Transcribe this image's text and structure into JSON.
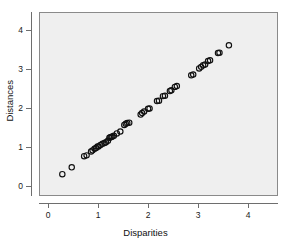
{
  "chart_data": {
    "type": "scatter",
    "title": "",
    "xlabel": "Disparities",
    "ylabel": "Distances",
    "xlim": [
      -0.18,
      4.6
    ],
    "ylim": [
      -0.27,
      4.46
    ],
    "xticks": [
      0,
      1,
      2,
      3,
      4
    ],
    "yticks": [
      0,
      1,
      2,
      3,
      4
    ],
    "xtick_labels": [
      "0",
      "1",
      "2",
      "3",
      "4"
    ],
    "ytick_labels": [
      "0",
      "1",
      "2",
      "3",
      "4"
    ],
    "grid": false,
    "legend": false,
    "marker": "open-circle",
    "marker_color": "#101010",
    "panel_color": "#efefef",
    "border_color": "#8a8a8a",
    "n_points": 50,
    "series": [
      {
        "name": "points",
        "points": [
          [
            0.27,
            0.27
          ],
          [
            0.46,
            0.45
          ],
          [
            0.71,
            0.74
          ],
          [
            0.76,
            0.76
          ],
          [
            0.85,
            0.86
          ],
          [
            0.88,
            0.89
          ],
          [
            0.92,
            0.93
          ],
          [
            0.95,
            0.95
          ],
          [
            0.98,
            0.99
          ],
          [
            1.0,
            0.99
          ],
          [
            1.04,
            1.03
          ],
          [
            1.08,
            1.06
          ],
          [
            1.12,
            1.08
          ],
          [
            1.15,
            1.1
          ],
          [
            1.19,
            1.14
          ],
          [
            1.22,
            1.22
          ],
          [
            1.24,
            1.23
          ],
          [
            1.26,
            1.24
          ],
          [
            1.28,
            1.25
          ],
          [
            1.31,
            1.27
          ],
          [
            1.37,
            1.33
          ],
          [
            1.44,
            1.38
          ],
          [
            1.52,
            1.55
          ],
          [
            1.55,
            1.58
          ],
          [
            1.58,
            1.6
          ],
          [
            1.62,
            1.61
          ],
          [
            1.85,
            1.82
          ],
          [
            1.88,
            1.86
          ],
          [
            1.92,
            1.9
          ],
          [
            2.0,
            1.97
          ],
          [
            2.03,
            1.98
          ],
          [
            2.18,
            2.17
          ],
          [
            2.22,
            2.18
          ],
          [
            2.3,
            2.3
          ],
          [
            2.34,
            2.31
          ],
          [
            2.44,
            2.43
          ],
          [
            2.47,
            2.45
          ],
          [
            2.54,
            2.54
          ],
          [
            2.58,
            2.56
          ],
          [
            2.87,
            2.84
          ],
          [
            2.91,
            2.86
          ],
          [
            3.03,
            3.02
          ],
          [
            3.07,
            3.06
          ],
          [
            3.11,
            3.1
          ],
          [
            3.15,
            3.12
          ],
          [
            3.21,
            3.21
          ],
          [
            3.25,
            3.23
          ],
          [
            3.41,
            3.42
          ],
          [
            3.44,
            3.43
          ],
          [
            3.63,
            3.62
          ]
        ]
      }
    ]
  },
  "axes": {
    "x": {
      "title": "Disparities",
      "ticks": [
        {
          "value": 0,
          "label": "0"
        },
        {
          "value": 1,
          "label": "1"
        },
        {
          "value": 2,
          "label": "2"
        },
        {
          "value": 3,
          "label": "3"
        },
        {
          "value": 4,
          "label": "4"
        }
      ]
    },
    "y": {
      "title": "Distances",
      "ticks": [
        {
          "value": 0,
          "label": "0"
        },
        {
          "value": 1,
          "label": "1"
        },
        {
          "value": 2,
          "label": "2"
        },
        {
          "value": 3,
          "label": "3"
        },
        {
          "value": 4,
          "label": "4"
        }
      ]
    }
  }
}
